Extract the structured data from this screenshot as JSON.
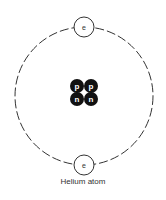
{
  "diagram": {
    "title": "Helium atom",
    "nucleus": [
      {
        "label": "p",
        "type": "proton"
      },
      {
        "label": "p",
        "type": "proton"
      },
      {
        "label": "n",
        "type": "neutron"
      },
      {
        "label": "n",
        "type": "neutron"
      }
    ],
    "electrons": [
      {
        "label": "e",
        "position": "top"
      },
      {
        "label": "e",
        "position": "bottom"
      }
    ],
    "colors": {
      "particle": "#111111",
      "line": "#333333",
      "background": "#ffffff"
    }
  }
}
